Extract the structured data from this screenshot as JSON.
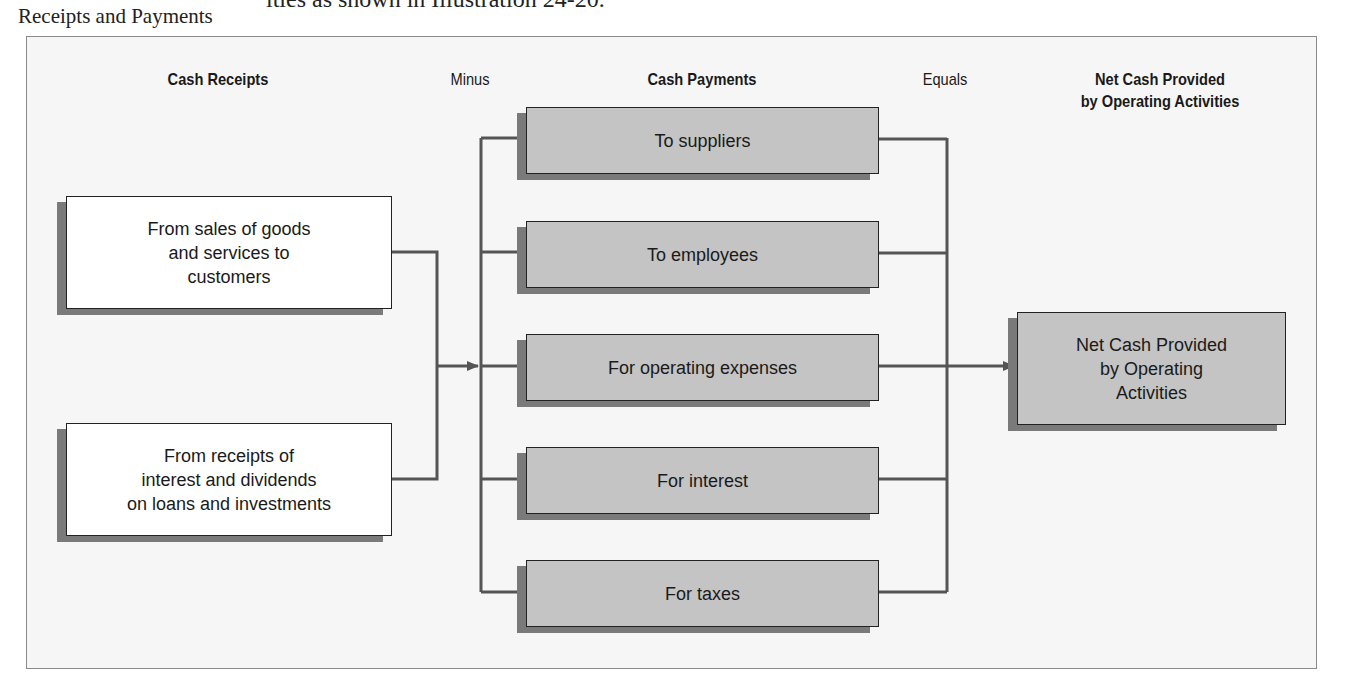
{
  "page": {
    "top_text": "ities as shown in Illustration 24-20.",
    "margin_label": "Receipts and Payments"
  },
  "headers": {
    "cash_receipts": "Cash Receipts",
    "minus": "Minus",
    "cash_payments": "Cash Payments",
    "equals": "Equals",
    "net_cash_line1": "Net Cash Provided",
    "net_cash_line2": "by Operating Activities"
  },
  "receipts": [
    {
      "lines": [
        "From sales of goods",
        "and services to",
        "customers"
      ]
    },
    {
      "lines": [
        "From receipts of",
        "interest and dividends",
        "on loans and investments"
      ]
    }
  ],
  "payments": [
    {
      "label": "To suppliers"
    },
    {
      "label": "To employees"
    },
    {
      "label": "For operating expenses"
    },
    {
      "label": "For interest"
    },
    {
      "label": "For taxes"
    }
  ],
  "result": {
    "lines": [
      "Net Cash Provided",
      "by Operating",
      "Activities"
    ]
  },
  "colors": {
    "receipt_box_fill": "#ffffff",
    "payment_box_fill": "#c4c4c4",
    "shadow": "#7a7a7a",
    "connector": "#555555",
    "frame_fill": "#f6f6f6"
  }
}
